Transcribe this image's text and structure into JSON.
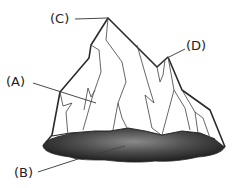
{
  "diagram": {
    "labels": [
      {
        "id": "C",
        "text": "(C)",
        "points_to": "summit peak"
      },
      {
        "id": "D",
        "text": "(D)",
        "points_to": "secondary right peak"
      },
      {
        "id": "A",
        "text": "(A)",
        "points_to": "left face of the mass"
      },
      {
        "id": "B",
        "text": "(B)",
        "points_to": "dark shaded base"
      }
    ],
    "colors": {
      "outline": "#2a2a2a",
      "face_lines": "#555555",
      "fill": "#ffffff",
      "base_dark": "#1e1e1e",
      "base_light": "#8a8a8a",
      "label_text": "#222222"
    }
  }
}
